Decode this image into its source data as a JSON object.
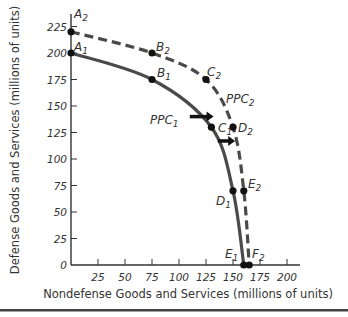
{
  "chart_data": {
    "type": "line",
    "title": "",
    "xlabel": "Nondefense Goods and Services (millions of units)",
    "ylabel": "Defense Goods and Services (millions of units)",
    "xlim": [
      0,
      225
    ],
    "ylim": [
      0,
      235
    ],
    "x_ticks": [
      25,
      50,
      75,
      100,
      125,
      150,
      175,
      200
    ],
    "y_ticks": [
      0,
      25,
      50,
      75,
      100,
      125,
      150,
      175,
      200,
      225
    ],
    "grid": false,
    "series": [
      {
        "name": "PPC1",
        "style": "solid",
        "color": "#4a4a4a",
        "points": [
          {
            "label": "A1",
            "x": 0,
            "y": 200
          },
          {
            "label": "B1",
            "x": 75,
            "y": 175
          },
          {
            "label": "C1",
            "x": 130,
            "y": 130
          },
          {
            "label": "D1",
            "x": 150,
            "y": 70
          },
          {
            "label": "E1",
            "x": 160,
            "y": 0
          }
        ]
      },
      {
        "name": "PPC2",
        "style": "dashed",
        "color": "#4a4a4a",
        "points": [
          {
            "label": "A2",
            "x": 0,
            "y": 220
          },
          {
            "label": "B2",
            "x": 75,
            "y": 200
          },
          {
            "label": "C2",
            "x": 125,
            "y": 175
          },
          {
            "label": "D2",
            "x": 150,
            "y": 130
          },
          {
            "label": "E2",
            "x": 160,
            "y": 70
          },
          {
            "label": "F2",
            "x": 165,
            "y": 0
          }
        ]
      }
    ],
    "annotations": [
      {
        "type": "arrow",
        "direction": "right",
        "from": [
          110,
          140
        ],
        "to": [
          132,
          140
        ],
        "note": "outward shift PPC1 to PPC2"
      },
      {
        "type": "arrow",
        "direction": "right",
        "from": [
          136,
          117
        ],
        "to": [
          152,
          117
        ],
        "note": "outward shift PPC1 to PPC2"
      },
      {
        "type": "curve-label",
        "text": "PPC1",
        "x": 95,
        "y": 135
      },
      {
        "type": "curve-label",
        "text": "PPC2",
        "x": 145,
        "y": 150
      }
    ]
  },
  "labels": {
    "ppc1": "PPC",
    "ppc1_sub": "1",
    "ppc2": "PPC",
    "ppc2_sub": "2"
  }
}
